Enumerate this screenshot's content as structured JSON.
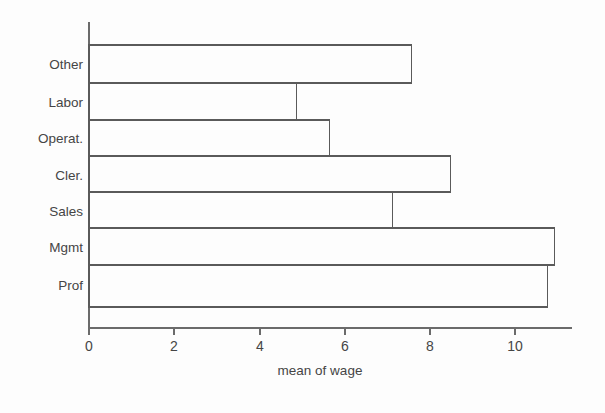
{
  "chart_data": {
    "type": "bar",
    "orientation": "horizontal",
    "title": "",
    "subtitle": "",
    "xlabel": "mean of wage",
    "ylabel": "",
    "categories": [
      "Other",
      "Labor",
      "Operat.",
      "Cler.",
      "Sales",
      "Mgmt",
      "Prof"
    ],
    "values": [
      7.56,
      4.87,
      5.64,
      8.48,
      7.11,
      10.92,
      10.75
    ],
    "xlim": [
      0,
      11.35
    ],
    "xticks": [
      0,
      2,
      4,
      6,
      8,
      10
    ],
    "xtick_labels": [
      "0",
      "2",
      "4",
      "6",
      "8",
      "10"
    ],
    "yticks": [],
    "grid": false,
    "legend": false,
    "legend_position": "none",
    "bar_fill": "none",
    "bar_stroke": "#5a5a5a",
    "axis_color": "#6b6b6b",
    "background": "#fdfdfd",
    "annotations": []
  },
  "axis": {
    "x_title": "mean of wage",
    "tick0": "0",
    "tick1": "2",
    "tick2": "4",
    "tick3": "6",
    "tick4": "8",
    "tick5": "10"
  },
  "categories": {
    "c0": "Other",
    "c1": "Labor",
    "c2": "Operat.",
    "c3": "Cler.",
    "c4": "Sales",
    "c5": "Mgmt",
    "c6": "Prof"
  }
}
